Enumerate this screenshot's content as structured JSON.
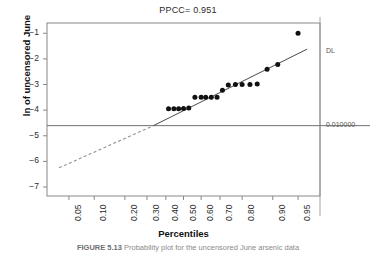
{
  "figure": {
    "caption_label": "FIGURE 5.13",
    "caption_text": "Probability plot for the uncensored June arsenic data"
  },
  "chart_data": {
    "type": "scatter",
    "title": "PPCC= 0.951",
    "xlabel": "Percentiles",
    "ylabel": "ln of uncensored June",
    "grid": false,
    "legend": "none",
    "xscale": "normal-probability",
    "xlim": [
      0.025,
      0.975
    ],
    "ylim": [
      -7.35,
      -0.6
    ],
    "xticks": [
      "0.05",
      "0.10",
      "0.20",
      "0.30",
      "0.40",
      "0.50",
      "0.60",
      "0.70",
      "0.80",
      "0.90",
      "0.95"
    ],
    "xtick_values": [
      0.05,
      0.1,
      0.2,
      0.3,
      0.4,
      0.5,
      0.6,
      0.7,
      0.8,
      0.9,
      0.95
    ],
    "yticks": [
      "-1",
      "-2",
      "-3",
      "-4",
      "-5",
      "-6",
      "-7"
    ],
    "ytick_values": [
      -1,
      -2,
      -3,
      -4,
      -5,
      -6,
      -7
    ],
    "points_x": [
      0.415,
      0.445,
      0.472,
      0.5,
      0.53,
      0.565,
      0.6,
      0.625,
      0.655,
      0.685,
      0.712,
      0.74,
      0.772,
      0.8,
      0.83,
      0.855,
      0.885,
      0.912,
      0.95
    ],
    "points_y": [
      -3.95,
      -3.95,
      -3.95,
      -3.94,
      -3.92,
      -3.5,
      -3.5,
      -3.5,
      -3.5,
      -3.5,
      -3.22,
      -3.02,
      -3.0,
      -3.0,
      -3.0,
      -2.98,
      -2.4,
      -2.22,
      -1.0
    ],
    "fit_line": {
      "style": "solid",
      "x_start": 0.333,
      "y_start": -4.605,
      "x_end": 0.962,
      "y_end": -1.62
    },
    "extrapolated_line": {
      "style": "dashed",
      "x_start": 0.037,
      "y_start": -6.25,
      "x_end": 0.333,
      "y_end": -4.605
    },
    "detection_limit": {
      "label_right": "DL",
      "value_label": "0.010000",
      "y_value": -4.605,
      "line_style": "solid",
      "color": "#707070"
    },
    "colors": {
      "marker": "#111111",
      "fit_line": "#4a4a4a",
      "dashed_line": "#909090",
      "axis": "#888888",
      "text": "#2b2b2b"
    }
  }
}
